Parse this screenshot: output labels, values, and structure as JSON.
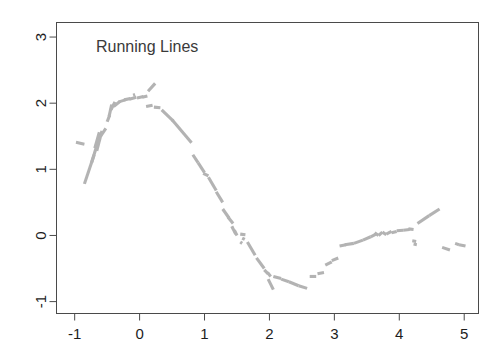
{
  "chart_data": {
    "type": "line",
    "title": "Running Lines",
    "xlabel": "",
    "ylabel": "",
    "xlim": [
      -1.28,
      5.22
    ],
    "ylim": [
      -1.18,
      3.22
    ],
    "grid": false,
    "legend": null,
    "x_ticks": [
      -1,
      0,
      1,
      2,
      3,
      4,
      5
    ],
    "x_tick_labels": [
      "-1",
      "0",
      "1",
      "2",
      "3",
      "4",
      "5"
    ],
    "y_ticks": [
      -1,
      0,
      1,
      2,
      3
    ],
    "y_tick_labels": [
      "-1",
      "0",
      "1",
      "2",
      "3"
    ],
    "y_axis_label_rotation": -90,
    "series_color": "#b3b3b3",
    "series_name": "running lines smoother",
    "segments": [
      {
        "x1": -0.98,
        "y1": 1.41,
        "x2": -0.85,
        "y2": 1.38
      },
      {
        "x1": -0.85,
        "y1": 0.78,
        "x2": -0.7,
        "y2": 1.22
      },
      {
        "x1": -0.74,
        "y1": 1.1,
        "x2": -0.63,
        "y2": 1.45
      },
      {
        "x1": -0.69,
        "y1": 1.32,
        "x2": -0.62,
        "y2": 1.56
      },
      {
        "x1": -0.66,
        "y1": 1.28,
        "x2": -0.58,
        "y2": 1.58
      },
      {
        "x1": -0.6,
        "y1": 1.5,
        "x2": -0.52,
        "y2": 1.62
      },
      {
        "x1": -0.5,
        "y1": 1.72,
        "x2": -0.46,
        "y2": 1.82
      },
      {
        "x1": -0.47,
        "y1": 1.8,
        "x2": -0.43,
        "y2": 1.98
      },
      {
        "x1": -0.44,
        "y1": 1.9,
        "x2": -0.38,
        "y2": 2.02
      },
      {
        "x1": -0.4,
        "y1": 1.95,
        "x2": -0.3,
        "y2": 2.03
      },
      {
        "x1": -0.32,
        "y1": 2.02,
        "x2": -0.22,
        "y2": 2.05
      },
      {
        "x1": -0.24,
        "y1": 2.05,
        "x2": -0.14,
        "y2": 2.07
      },
      {
        "x1": -0.16,
        "y1": 2.06,
        "x2": -0.05,
        "y2": 2.09
      },
      {
        "x1": -0.1,
        "y1": 2.12,
        "x2": -0.07,
        "y2": 2.13
      },
      {
        "x1": -0.04,
        "y1": 2.08,
        "x2": 0.06,
        "y2": 2.1
      },
      {
        "x1": 0.04,
        "y1": 2.09,
        "x2": 0.12,
        "y2": 2.11
      },
      {
        "x1": 0.13,
        "y1": 2.18,
        "x2": 0.24,
        "y2": 2.3
      },
      {
        "x1": 0.1,
        "y1": 1.95,
        "x2": 0.2,
        "y2": 1.97
      },
      {
        "x1": 0.22,
        "y1": 1.94,
        "x2": 0.32,
        "y2": 1.93
      },
      {
        "x1": 0.34,
        "y1": 1.9,
        "x2": 0.52,
        "y2": 1.73
      },
      {
        "x1": 0.5,
        "y1": 1.75,
        "x2": 0.8,
        "y2": 1.4
      },
      {
        "x1": 0.82,
        "y1": 1.22,
        "x2": 0.9,
        "y2": 1.1
      },
      {
        "x1": 0.9,
        "y1": 1.1,
        "x2": 1.0,
        "y2": 0.95
      },
      {
        "x1": 0.98,
        "y1": 0.94,
        "x2": 1.06,
        "y2": 0.9
      },
      {
        "x1": 1.06,
        "y1": 0.88,
        "x2": 1.18,
        "y2": 0.68
      },
      {
        "x1": 1.18,
        "y1": 0.66,
        "x2": 1.28,
        "y2": 0.5
      },
      {
        "x1": 1.28,
        "y1": 0.4,
        "x2": 1.38,
        "y2": 0.26
      },
      {
        "x1": 1.36,
        "y1": 0.28,
        "x2": 1.44,
        "y2": 0.18
      },
      {
        "x1": 1.42,
        "y1": 0.14,
        "x2": 1.48,
        "y2": 0.02
      },
      {
        "x1": 1.46,
        "y1": 0.08,
        "x2": 1.5,
        "y2": 0.0
      },
      {
        "x1": 1.55,
        "y1": 0.02,
        "x2": 1.63,
        "y2": 0.01
      },
      {
        "x1": 1.58,
        "y1": -0.04,
        "x2": 1.62,
        "y2": -0.06
      },
      {
        "x1": 1.55,
        "y1": -0.1,
        "x2": 1.58,
        "y2": -0.12
      },
      {
        "x1": 1.66,
        "y1": -0.1,
        "x2": 1.78,
        "y2": -0.3
      },
      {
        "x1": 1.8,
        "y1": -0.34,
        "x2": 1.92,
        "y2": -0.5
      },
      {
        "x1": 1.92,
        "y1": -0.52,
        "x2": 1.98,
        "y2": -0.58
      },
      {
        "x1": 1.97,
        "y1": -0.56,
        "x2": 2.02,
        "y2": -0.62
      },
      {
        "x1": 1.98,
        "y1": -0.66,
        "x2": 2.06,
        "y2": -0.82
      },
      {
        "x1": 2.06,
        "y1": -0.62,
        "x2": 2.18,
        "y2": -0.65
      },
      {
        "x1": 2.18,
        "y1": -0.66,
        "x2": 2.3,
        "y2": -0.7
      },
      {
        "x1": 2.3,
        "y1": -0.7,
        "x2": 2.45,
        "y2": -0.76
      },
      {
        "x1": 2.45,
        "y1": -0.76,
        "x2": 2.58,
        "y2": -0.8
      },
      {
        "x1": 2.62,
        "y1": -0.62,
        "x2": 2.72,
        "y2": -0.62
      },
      {
        "x1": 2.74,
        "y1": -0.58,
        "x2": 2.84,
        "y2": -0.56
      },
      {
        "x1": 2.86,
        "y1": -0.45,
        "x2": 2.96,
        "y2": -0.4
      },
      {
        "x1": 2.96,
        "y1": -0.38,
        "x2": 3.06,
        "y2": -0.34
      },
      {
        "x1": 3.08,
        "y1": -0.16,
        "x2": 3.18,
        "y2": -0.14
      },
      {
        "x1": 3.16,
        "y1": -0.14,
        "x2": 3.3,
        "y2": -0.12
      },
      {
        "x1": 3.3,
        "y1": -0.12,
        "x2": 3.44,
        "y2": -0.07
      },
      {
        "x1": 3.44,
        "y1": -0.07,
        "x2": 3.56,
        "y2": -0.02
      },
      {
        "x1": 3.56,
        "y1": -0.02,
        "x2": 3.64,
        "y2": 0.02
      },
      {
        "x1": 3.62,
        "y1": 0.04,
        "x2": 3.68,
        "y2": 0.0
      },
      {
        "x1": 3.68,
        "y1": 0.0,
        "x2": 3.74,
        "y2": 0.05
      },
      {
        "x1": 3.74,
        "y1": 0.05,
        "x2": 3.8,
        "y2": 0.01
      },
      {
        "x1": 3.8,
        "y1": 0.02,
        "x2": 3.88,
        "y2": 0.06
      },
      {
        "x1": 3.88,
        "y1": 0.04,
        "x2": 3.96,
        "y2": 0.06
      },
      {
        "x1": 3.96,
        "y1": 0.07,
        "x2": 4.06,
        "y2": 0.08
      },
      {
        "x1": 4.06,
        "y1": 0.08,
        "x2": 4.16,
        "y2": 0.09
      },
      {
        "x1": 4.14,
        "y1": 0.1,
        "x2": 4.22,
        "y2": 0.09
      },
      {
        "x1": 4.2,
        "y1": -0.08,
        "x2": 4.26,
        "y2": -0.09
      },
      {
        "x1": 4.22,
        "y1": -0.13,
        "x2": 4.27,
        "y2": -0.14
      },
      {
        "x1": 4.28,
        "y1": 0.18,
        "x2": 4.46,
        "y2": 0.3
      },
      {
        "x1": 4.46,
        "y1": 0.3,
        "x2": 4.62,
        "y2": 0.4
      },
      {
        "x1": 4.66,
        "y1": -0.18,
        "x2": 4.78,
        "y2": -0.22
      },
      {
        "x1": 4.86,
        "y1": -0.12,
        "x2": 4.92,
        "y2": -0.14
      },
      {
        "x1": 4.92,
        "y1": -0.14,
        "x2": 5.02,
        "y2": -0.16
      }
    ]
  },
  "axes": {
    "title_text": "Running Lines"
  }
}
